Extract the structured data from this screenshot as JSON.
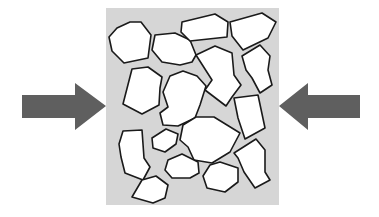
{
  "diagram": {
    "title": "",
    "colors": {
      "background": "#ffffff",
      "container_fill": "#d6d6d6",
      "particle_fill": "#ffffff",
      "particle_stroke": "#1a1a1a",
      "arrow_fill": "#5f5f5f"
    },
    "container": {
      "x": 106,
      "y": 8,
      "width": 173,
      "height": 197
    },
    "arrows": [
      {
        "name": "left-arrow",
        "direction": "right",
        "points": "22,95 75,95 75,83 106,106 75,130 75,118 22,118"
      },
      {
        "name": "right-arrow",
        "direction": "left",
        "points": "360,95 308,95 308,83 279,106 308,130 308,118 360,118"
      }
    ],
    "particles": [
      {
        "id": "A",
        "points": "130,22 141,22 151,35 148,58 124,63 112,51 109,37 117,28"
      },
      {
        "id": "B",
        "points": "155,35 175,33 190,40 196,55 192,62 180,65 162,62 152,50"
      },
      {
        "id": "C",
        "points": "182,22 215,14 228,22 227,37 190,41 181,32"
      },
      {
        "id": "D",
        "points": "230,22 262,13 276,22 268,38 243,50 232,36"
      },
      {
        "id": "E",
        "points": "132,69 148,67 162,77 160,88 159,105 142,114 123,104"
      },
      {
        "id": "F",
        "points": "170,76 183,71 197,76 206,86 200,105 195,118 178,126 163,125 160,113 168,107 163,92"
      },
      {
        "id": "G",
        "points": "196,55 215,46 232,53 234,75 241,85 232,97 226,106 205,90 212,80"
      },
      {
        "id": "H",
        "points": "242,56 260,45 270,56 268,70 272,85 260,93 252,78 246,70"
      },
      {
        "id": "I",
        "points": "234,98 258,95 265,128 245,139 238,118"
      },
      {
        "id": "J",
        "points": "183,125 196,117 214,117 240,133 230,152 212,163 194,160 188,147 180,140"
      },
      {
        "id": "K",
        "points": "123,131 142,130 144,158 150,167 143,180 125,173 121,157 119,144"
      },
      {
        "id": "L",
        "points": "152,138 166,129 178,134 176,144 165,152 153,148"
      },
      {
        "id": "M",
        "points": "142,180 156,176 168,185 165,198 153,203 132,197"
      },
      {
        "id": "N",
        "points": "168,160 182,154 198,162 199,173 190,178 172,178 165,170"
      },
      {
        "id": "O",
        "points": "210,165 220,162 238,168 238,182 225,192 207,188 203,176"
      },
      {
        "id": "P",
        "points": "234,153 256,139 265,150 265,172 270,180 255,188 244,172 238,158"
      }
    ]
  }
}
